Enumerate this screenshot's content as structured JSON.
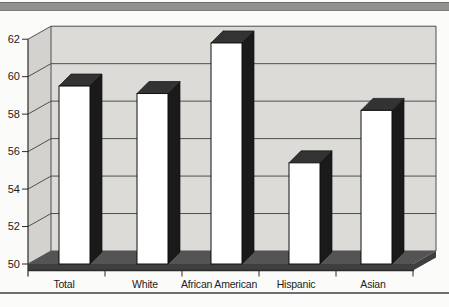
{
  "chart_data": {
    "type": "bar",
    "projection": "3d-column",
    "title": "",
    "xlabel": "",
    "ylabel": "",
    "categories": [
      "Total",
      "White",
      "African American",
      "Hispanic",
      "Asian"
    ],
    "values": [
      59.5,
      59.1,
      61.8,
      55.4,
      58.2
    ],
    "ylim": [
      50,
      62
    ],
    "yticks": [
      50,
      52,
      54,
      56,
      58,
      60,
      62
    ],
    "grid": true,
    "legend": "none",
    "colors": {
      "bar_front": "#ffffff",
      "bar_top": "#333333",
      "bar_side": "#1a1a1a",
      "bar_outline": "#111111",
      "wall": "#dcdbd7",
      "side_wall": "#d3d2ce",
      "floor": "#545454",
      "floor_front": "#3f3f3f",
      "gridline": "#4f4f4f",
      "axis_line": "#2b2b2b",
      "axis_text": "#1c1c1c",
      "top_band": "#929190",
      "bottom_rule": "#6e6e6e",
      "page_background": "#fbfbf9"
    }
  }
}
